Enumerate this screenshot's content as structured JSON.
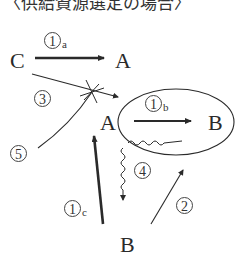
{
  "header": {
    "title": "〈供給資源選定の場合〉"
  },
  "nodes": {
    "c_top": "C",
    "a_top": "A",
    "a_mid": "A",
    "b_mid": "B",
    "b_bottom": "B"
  },
  "labels": {
    "l1a": {
      "num": "1",
      "sub": "a"
    },
    "l1b": {
      "num": "1",
      "sub": "b"
    },
    "l1c": {
      "num": "1",
      "sub": "c"
    },
    "l2": {
      "num": "2"
    },
    "l3": {
      "num": "3"
    },
    "l4": {
      "num": "4"
    },
    "l5": {
      "num": "5"
    }
  },
  "colors": {
    "ink": "#2a2a2a",
    "background": "#ffffff"
  }
}
